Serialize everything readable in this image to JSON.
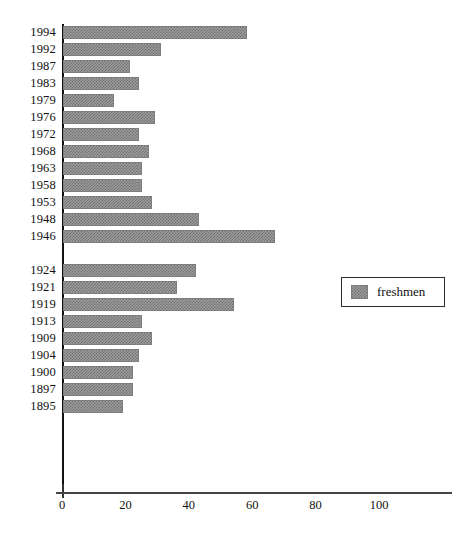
{
  "chart_data": {
    "type": "bar",
    "orientation": "horizontal",
    "title": "",
    "xlabel": "",
    "ylabel": "",
    "xlim": [
      0,
      110
    ],
    "xticks": [
      0,
      20,
      40,
      60,
      80,
      100
    ],
    "xtick_labels": [
      "0",
      "20",
      "40",
      "60",
      "80",
      "100"
    ],
    "grid": false,
    "legend": {
      "position": "center-right",
      "entries": [
        {
          "name": "freshmen",
          "pattern": "cross-hatch",
          "color": "#9e9e9e"
        }
      ]
    },
    "series": [
      {
        "name": "freshmen",
        "categories": [
          "1994",
          "1992",
          "1987",
          "1983",
          "1979",
          "1976",
          "1972",
          "1968",
          "1963",
          "1958",
          "1953",
          "1948",
          "1946",
          "",
          "1924",
          "1921",
          "1919",
          "1913",
          "1909",
          "1904",
          "1900",
          "1897",
          "1895"
        ],
        "values": [
          58,
          31,
          21,
          24,
          16,
          29,
          24,
          27,
          25,
          25,
          28,
          43,
          67,
          null,
          42,
          36,
          54,
          25,
          28,
          24,
          22,
          22,
          19
        ]
      }
    ],
    "categories": [
      "1994",
      "1992",
      "1987",
      "1983",
      "1979",
      "1976",
      "1972",
      "1968",
      "1963",
      "1958",
      "1953",
      "1948",
      "1946",
      "",
      "1924",
      "1921",
      "1919",
      "1913",
      "1909",
      "1904",
      "1900",
      "1897",
      "1895"
    ],
    "values": [
      58,
      31,
      21,
      24,
      16,
      29,
      24,
      27,
      25,
      25,
      28,
      43,
      67,
      null,
      42,
      36,
      54,
      25,
      28,
      24,
      22,
      22,
      19
    ],
    "bars": [
      {
        "label": "1994",
        "value": 58
      },
      {
        "label": "1992",
        "value": 31
      },
      {
        "label": "1987",
        "value": 21
      },
      {
        "label": "1983",
        "value": 24
      },
      {
        "label": "1979",
        "value": 16
      },
      {
        "label": "1976",
        "value": 29
      },
      {
        "label": "1972",
        "value": 24
      },
      {
        "label": "1968",
        "value": 27
      },
      {
        "label": "1963",
        "value": 25
      },
      {
        "label": "1958",
        "value": 25
      },
      {
        "label": "1953",
        "value": 28
      },
      {
        "label": "1948",
        "value": 43
      },
      {
        "label": "1946",
        "value": 67
      },
      {
        "label": "",
        "value": null
      },
      {
        "label": "1924",
        "value": 42
      },
      {
        "label": "1921",
        "value": 36
      },
      {
        "label": "1919",
        "value": 54
      },
      {
        "label": "1913",
        "value": 25
      },
      {
        "label": "1909",
        "value": 28
      },
      {
        "label": "1904",
        "value": 24
      },
      {
        "label": "1900",
        "value": 22
      },
      {
        "label": "1897",
        "value": 22
      },
      {
        "label": "1895",
        "value": 19
      }
    ]
  }
}
